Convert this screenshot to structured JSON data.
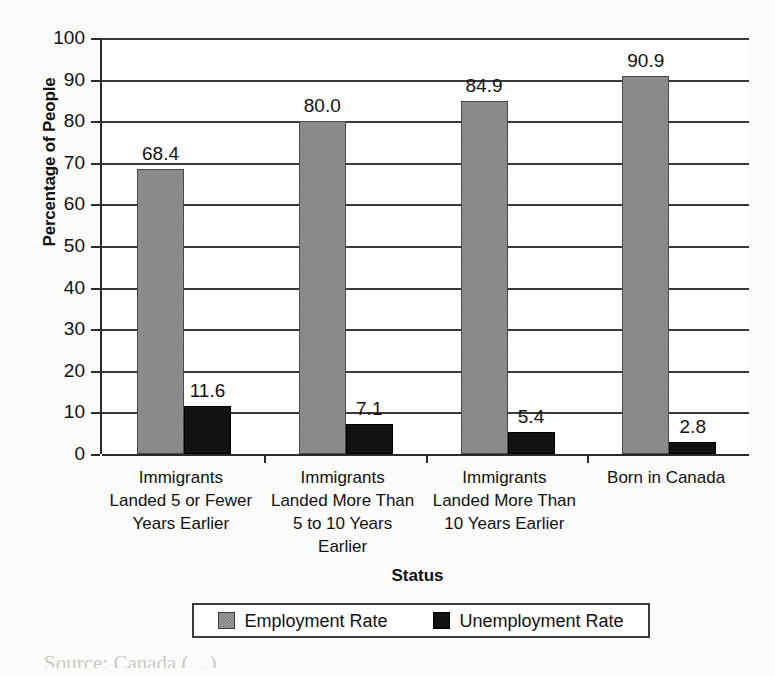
{
  "chart_data": {
    "type": "bar",
    "title": "",
    "xlabel": "Status",
    "ylabel": "Percentage of People",
    "ylim": [
      0,
      100
    ],
    "ytick_step": 10,
    "yticks": [
      0,
      10,
      20,
      30,
      40,
      50,
      60,
      70,
      80,
      90,
      100
    ],
    "ytick_labels": [
      "0",
      "10",
      "20",
      "30",
      "40",
      "50",
      "60",
      "70",
      "80",
      "90",
      "100"
    ],
    "grid": true,
    "legend_position": "bottom",
    "categories": [
      "Immigrants\nLanded 5 or Fewer\nYears Earlier",
      "Immigrants\nLanded More Than\n5 to 10 Years\nEarlier",
      "Immigrants\nLanded More Than\n10 Years Earlier",
      "Born in Canada"
    ],
    "series": [
      {
        "name": "Employment Rate",
        "color": "#808080",
        "values": [
          68.4,
          80.0,
          84.9,
          90.9
        ],
        "labels": [
          "68.4",
          "80.0",
          "84.9",
          "90.9"
        ]
      },
      {
        "name": "Unemployment Rate",
        "color": "#121212",
        "values": [
          11.6,
          7.1,
          5.4,
          2.8
        ],
        "labels": [
          "11.6",
          "7.1",
          "5.4",
          "2.8"
        ]
      }
    ]
  },
  "legend": {
    "entries": [
      {
        "label": "Employment Rate",
        "swatch": "employment-swatch"
      },
      {
        "label": "Unemployment Rate",
        "swatch": "unemployment-swatch"
      }
    ]
  },
  "caption": {
    "cut_off_text": "Source: Canada (....)"
  }
}
